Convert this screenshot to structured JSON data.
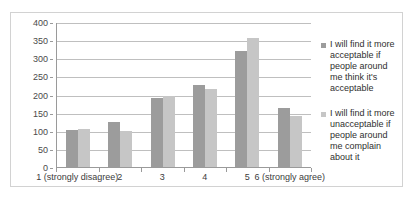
{
  "chart_data": {
    "type": "bar",
    "title": "",
    "xlabel": "",
    "ylabel": "",
    "ylim": [
      0,
      400
    ],
    "ytick_step": 50,
    "yticks": [
      400,
      350,
      300,
      250,
      200,
      150,
      100,
      50,
      0
    ],
    "grid": true,
    "legend_position": "right",
    "categories": [
      "1 (strongly disagree)",
      "2",
      "3",
      "4",
      "5",
      "6 (strongly agree)"
    ],
    "series": [
      {
        "name": "I will find it more acceptable if people around me think it's acceptable",
        "color": "#9c9c9c",
        "values": [
          101,
          123,
          190,
          225,
          320,
          162
        ]
      },
      {
        "name": "I will find it more unacceptable if people around me complain about it",
        "color": "#c6c6c6",
        "values": [
          106,
          100,
          197,
          215,
          355,
          142
        ]
      }
    ]
  },
  "legend": {
    "entries": [
      {
        "label": "I will find it more acceptable if people around me think it's acceptable"
      },
      {
        "label": "I will find it more unacceptable if people around me complain about it"
      }
    ]
  },
  "caption": {
    "text": ""
  }
}
